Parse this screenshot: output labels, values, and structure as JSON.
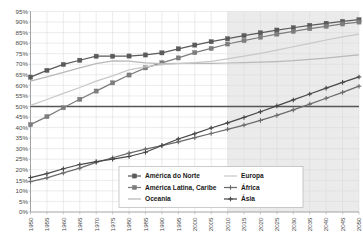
{
  "chart_data": {
    "type": "line",
    "title": "",
    "subtitle": "",
    "xlabel": "",
    "ylabel": "",
    "xlim": [
      1950,
      2050
    ],
    "ylim": [
      0,
      95
    ],
    "grid": true,
    "legend_position": "bottom-center",
    "y_tick_labels": [
      "0%",
      "5%",
      "10%",
      "15%",
      "20%",
      "25%",
      "30%",
      "35%",
      "40%",
      "45%",
      "50%",
      "55%",
      "60%",
      "65%",
      "70%",
      "75%",
      "80%",
      "85%",
      "90%",
      "95%"
    ],
    "y_ticks": [
      0,
      5,
      10,
      15,
      20,
      25,
      30,
      35,
      40,
      45,
      50,
      55,
      60,
      65,
      70,
      75,
      80,
      85,
      90,
      95
    ],
    "x": [
      1950,
      1955,
      1960,
      1965,
      1970,
      1975,
      1980,
      1985,
      1990,
      1995,
      2000,
      2005,
      2010,
      2015,
      2020,
      2025,
      2030,
      2035,
      2040,
      2045,
      2050
    ],
    "x_tick_labels": [
      "1950",
      "1955",
      "1960",
      "1965",
      "1970",
      "1975",
      "1980",
      "1985",
      "1990",
      "1995",
      "2000",
      "2005",
      "2010",
      "2015",
      "2020",
      "2025",
      "2030",
      "2035",
      "2040",
      "2045",
      "2050"
    ],
    "reference_line": {
      "value": 50,
      "label": "50%",
      "color": "#555555"
    },
    "projection_band": {
      "from": 2010,
      "to": 2050,
      "color": "#e8e8e8"
    },
    "series": [
      {
        "name": "América do Norte",
        "color": "#5a5a5a",
        "marker": "square",
        "values": [
          63.9,
          67.1,
          69.9,
          71.9,
          73.8,
          73.8,
          73.9,
          74.4,
          75.4,
          77.3,
          79.1,
          80.7,
          82.1,
          83.6,
          84.9,
          86.2,
          87.3,
          88.4,
          89.4,
          90.3,
          91.1
        ]
      },
      {
        "name": "América Latina, Caribe",
        "color": "#7d7d7d",
        "marker": "square",
        "values": [
          41.4,
          45.2,
          49.4,
          53.4,
          57.3,
          61.2,
          64.9,
          68.3,
          70.7,
          73.0,
          75.5,
          77.5,
          79.6,
          81.2,
          82.8,
          84.3,
          85.6,
          86.9,
          88.0,
          89.1,
          90.0
        ]
      },
      {
        "name": "Oceania",
        "color": "#b8b8b8",
        "marker": "none",
        "values": [
          62.0,
          64.0,
          66.2,
          68.3,
          70.3,
          71.6,
          71.5,
          70.7,
          70.3,
          70.4,
          70.4,
          70.4,
          70.6,
          70.8,
          71.0,
          71.3,
          71.7,
          72.3,
          72.9,
          73.7,
          74.4
        ]
      },
      {
        "name": "Europa",
        "color": "#c8c8c8",
        "marker": "none",
        "values": [
          50.5,
          53.3,
          56.2,
          59.0,
          62.0,
          64.5,
          67.3,
          68.8,
          69.8,
          70.3,
          70.8,
          71.4,
          72.6,
          73.8,
          75.2,
          76.7,
          78.3,
          79.9,
          81.5,
          83.0,
          84.3
        ]
      },
      {
        "name": "África",
        "color": "#6b6b6b",
        "marker": "cross",
        "values": [
          14.4,
          16.2,
          18.5,
          20.8,
          23.5,
          25.7,
          27.9,
          29.8,
          31.5,
          33.2,
          35.2,
          37.2,
          39.2,
          41.2,
          43.4,
          45.8,
          48.4,
          51.1,
          53.9,
          56.7,
          59.6
        ]
      },
      {
        "name": "Ásia",
        "color": "#484848",
        "marker": "cross",
        "values": [
          16.3,
          18.2,
          20.5,
          22.5,
          23.9,
          25.0,
          26.3,
          28.3,
          31.5,
          34.6,
          37.1,
          39.8,
          42.2,
          44.8,
          47.5,
          50.3,
          53.1,
          55.9,
          58.7,
          61.4,
          64.0
        ]
      }
    ],
    "legend": [
      {
        "label": "América do Norte",
        "color": "#5a5a5a",
        "marker": "square"
      },
      {
        "label": "Europa",
        "color": "#c8c8c8",
        "marker": "none"
      },
      {
        "label": "América Latina, Caribe",
        "color": "#7d7d7d",
        "marker": "square"
      },
      {
        "label": "África",
        "color": "#6b6b6b",
        "marker": "cross"
      },
      {
        "label": "Oceania",
        "color": "#b8b8b8",
        "marker": "none"
      },
      {
        "label": "Ásia",
        "color": "#484848",
        "marker": "cross"
      }
    ]
  }
}
